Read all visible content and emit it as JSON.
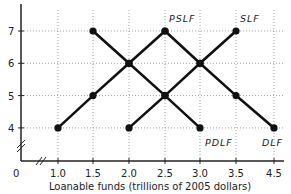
{
  "chart_data": {
    "type": "line",
    "title": "",
    "xlabel": "Loanable funds (trillions of 2005 dollars)",
    "ylabel": "",
    "origin_label": "0",
    "x_ticks": [
      "1.0",
      "1.5",
      "2.0",
      "2.5",
      "3.0",
      "3.5",
      "4.5"
    ],
    "y_ticks": [
      "4",
      "5",
      "6",
      "7"
    ],
    "grid": true,
    "series": [
      {
        "name": "PSLF",
        "points": [
          [
            1.0,
            4
          ],
          [
            1.5,
            5
          ],
          [
            2.0,
            6
          ],
          [
            2.5,
            7
          ]
        ]
      },
      {
        "name": "SLF",
        "points": [
          [
            2.0,
            4
          ],
          [
            2.5,
            5
          ],
          [
            3.0,
            6
          ],
          [
            3.5,
            7
          ]
        ]
      },
      {
        "name": "PDLF",
        "points": [
          [
            1.5,
            7
          ],
          [
            2.0,
            6
          ],
          [
            2.5,
            5
          ],
          [
            3.0,
            4
          ]
        ]
      },
      {
        "name": "DLF",
        "points": [
          [
            2.5,
            7
          ],
          [
            3.0,
            6
          ],
          [
            3.5,
            5
          ],
          [
            4.5,
            4
          ]
        ]
      }
    ]
  }
}
